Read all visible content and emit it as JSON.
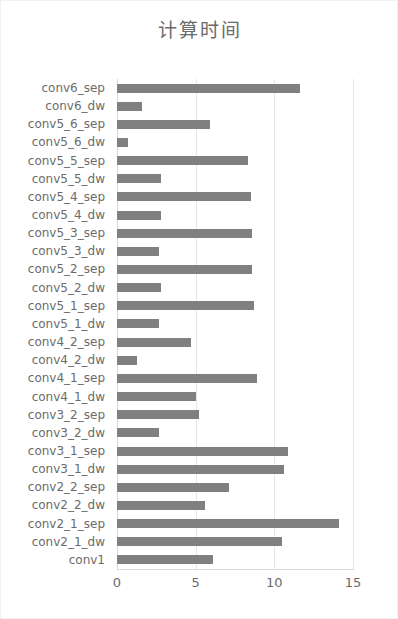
{
  "chart_data": {
    "type": "bar",
    "orientation": "horizontal",
    "title": "计算时间",
    "xlabel": "",
    "ylabel": "",
    "xlim": [
      0,
      15
    ],
    "ylim": null,
    "grid": true,
    "legend": null,
    "xticks": [
      "0",
      "5",
      "10",
      "15"
    ],
    "xtick_values": [
      0,
      5,
      10,
      15
    ],
    "bar_color": "#808080",
    "categories": [
      "conv6_sep",
      "conv6_dw",
      "conv5_6_sep",
      "conv5_6_dw",
      "conv5_5_sep",
      "conv5_5_dw",
      "conv5_4_sep",
      "conv5_4_dw",
      "conv5_3_sep",
      "conv5_3_dw",
      "conv5_2_sep",
      "conv5_2_dw",
      "conv5_1_sep",
      "conv5_1_dw",
      "conv4_2_sep",
      "conv4_2_dw",
      "conv4_1_sep",
      "conv4_1_dw",
      "conv3_2_sep",
      "conv3_2_dw",
      "conv3_1_sep",
      "conv3_1_dw",
      "conv2_2_sep",
      "conv2_2_dw",
      "conv2_1_sep",
      "conv2_1_dw",
      "conv1"
    ],
    "values": [
      11.6,
      1.6,
      5.9,
      0.7,
      8.3,
      2.8,
      8.5,
      2.8,
      8.6,
      2.7,
      8.6,
      2.8,
      8.7,
      2.7,
      4.7,
      1.3,
      8.9,
      5.0,
      5.2,
      2.7,
      10.9,
      10.6,
      7.1,
      5.6,
      14.1,
      10.5,
      6.1
    ]
  }
}
